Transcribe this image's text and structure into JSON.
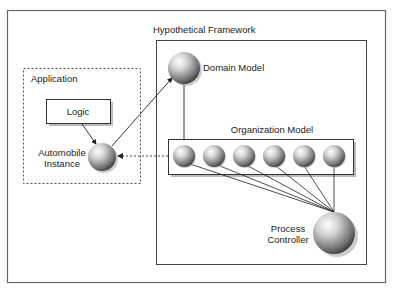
{
  "diagram": {
    "framework_title": "Hypothetical Framework",
    "application_title": "Application",
    "logic_label": "Logic",
    "automobile_label_line1": "Automobile",
    "automobile_label_line2": "Instance",
    "domain_model_label": "Domain Model",
    "organization_model_label": "Organization Model",
    "process_controller_line1": "Process",
    "process_controller_line2": "Controller",
    "organization_member_count": 6
  }
}
